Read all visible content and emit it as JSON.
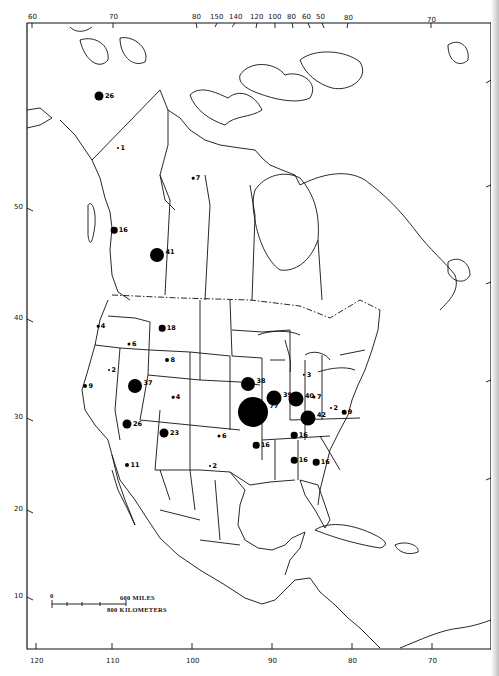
{
  "map": {
    "region": "North America",
    "frame": {
      "left": 27,
      "top": 23,
      "right": 491,
      "bottom": 649
    },
    "top_ticks": [
      {
        "label": "60",
        "x": 32
      },
      {
        "label": "70",
        "x": 113
      },
      {
        "label": "80",
        "x": 196
      },
      {
        "label": "150",
        "x": 217
      },
      {
        "label": "140",
        "x": 235
      },
      {
        "label": "120",
        "x": 257
      },
      {
        "label": "100",
        "x": 275
      },
      {
        "label": "80",
        "x": 292
      },
      {
        "label": "60",
        "x": 308
      },
      {
        "label": "50",
        "x": 322
      },
      {
        "label": "80",
        "x": 348
      },
      {
        "label": "70",
        "x": 431
      }
    ],
    "left_ticks": [
      {
        "label": "50",
        "y": 208
      },
      {
        "label": "40",
        "y": 319
      },
      {
        "label": "30",
        "y": 418
      },
      {
        "label": "20",
        "y": 510
      },
      {
        "label": "10",
        "y": 597
      }
    ],
    "bottom_ticks": [
      {
        "label": "120",
        "x": 36
      },
      {
        "label": "110",
        "x": 112
      },
      {
        "label": "100",
        "x": 192
      },
      {
        "label": "90",
        "x": 272
      },
      {
        "label": "80",
        "x": 352
      },
      {
        "label": "70",
        "x": 432
      }
    ],
    "scale_bar": {
      "zero_label": "0",
      "miles_label": "600 MILES",
      "km_label": "800 KILOMETERS"
    },
    "dots": [
      {
        "value": "26",
        "x": 99,
        "y": 96,
        "r": 4.5
      },
      {
        "value": "1",
        "x": 118,
        "y": 148,
        "r": 1
      },
      {
        "value": "7",
        "x": 193,
        "y": 178,
        "r": 1.3
      },
      {
        "value": "16",
        "x": 114,
        "y": 230,
        "r": 3.3
      },
      {
        "value": "41",
        "x": 157,
        "y": 255,
        "r": 7
      },
      {
        "value": "4",
        "x": 98,
        "y": 326,
        "r": 1.3
      },
      {
        "value": "18",
        "x": 162,
        "y": 328,
        "r": 3.3
      },
      {
        "value": "6",
        "x": 129,
        "y": 344,
        "r": 1.5
      },
      {
        "value": "8",
        "x": 167,
        "y": 360,
        "r": 2
      },
      {
        "value": "2",
        "x": 109,
        "y": 370,
        "r": 1
      },
      {
        "value": "37",
        "x": 135,
        "y": 386,
        "r": 7
      },
      {
        "value": "9",
        "x": 85,
        "y": 386,
        "r": 2
      },
      {
        "value": "4",
        "x": 173,
        "y": 397,
        "r": 1.3
      },
      {
        "value": "26",
        "x": 127,
        "y": 424,
        "r": 4.5
      },
      {
        "value": "23",
        "x": 164,
        "y": 433,
        "r": 4.5
      },
      {
        "value": "6",
        "x": 219,
        "y": 436,
        "r": 1.5
      },
      {
        "value": "11",
        "x": 127,
        "y": 465,
        "r": 2
      },
      {
        "value": "2",
        "x": 210,
        "y": 466,
        "r": 1
      },
      {
        "value": "38",
        "x": 248,
        "y": 384,
        "r": 7
      },
      {
        "value": "77",
        "x": 253,
        "y": 412,
        "r": 15
      },
      {
        "value": "39",
        "x": 274,
        "y": 398,
        "r": 7.5
      },
      {
        "value": "40",
        "x": 296,
        "y": 399,
        "r": 7.5
      },
      {
        "value": "3",
        "x": 304,
        "y": 375,
        "r": 1.2
      },
      {
        "value": "7",
        "x": 314,
        "y": 397,
        "r": 1.5
      },
      {
        "value": "2",
        "x": 331,
        "y": 408,
        "r": 1
      },
      {
        "value": "42",
        "x": 308,
        "y": 418,
        "r": 7.5
      },
      {
        "value": "9",
        "x": 344,
        "y": 412,
        "r": 2.3
      },
      {
        "value": "16",
        "x": 294,
        "y": 435,
        "r": 3.3
      },
      {
        "value": "16",
        "x": 256,
        "y": 445,
        "r": 3.3
      },
      {
        "value": "16",
        "x": 294,
        "y": 460,
        "r": 3.3
      },
      {
        "value": "16",
        "x": 316,
        "y": 462,
        "r": 3.3
      }
    ]
  }
}
